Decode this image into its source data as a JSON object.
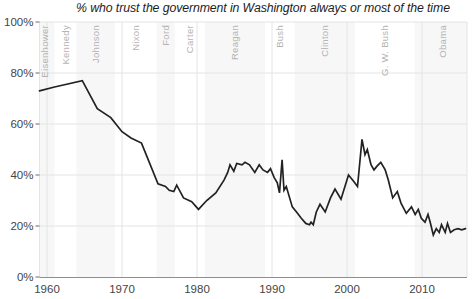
{
  "colors": {
    "line": "#222222",
    "grid": "#e4e4e4",
    "band": "#f7f7f7",
    "axis": "#8e8e8e",
    "tick": "#6a6a6a",
    "tick_label": "#454545",
    "president_label": "#b4b4b4",
    "title": "#1c1c1c",
    "background": "#ffffff"
  },
  "chart_data": {
    "type": "line",
    "title": "% who trust the government in Washington always or most of the time",
    "xlabel": "",
    "ylabel": "% who trust",
    "xlim": [
      1959,
      2016.5
    ],
    "ylim": [
      0,
      100
    ],
    "grid": true,
    "x_ticks": [
      1960,
      1970,
      1980,
      1990,
      2000,
      2010
    ],
    "x_tick_labels": [
      "1960",
      "1970",
      "1980",
      "1990",
      "2000",
      "2010"
    ],
    "y_ticks": [
      0,
      20,
      40,
      60,
      80,
      100
    ],
    "y_tick_labels": [
      "0%",
      "20%",
      "40%",
      "60%",
      "80%",
      "100%"
    ],
    "presidents": [
      {
        "name": "Eisenhower",
        "start": 1959,
        "end": 1961,
        "label_year": 1959.7,
        "shaded": true
      },
      {
        "name": "Kennedy",
        "start": 1961,
        "end": 1963.92,
        "label_year": 1962.4,
        "shaded": false
      },
      {
        "name": "Johnson",
        "start": 1963.92,
        "end": 1969.05,
        "label_year": 1966.4,
        "shaded": true
      },
      {
        "name": "Nixon",
        "start": 1969.05,
        "end": 1974.6,
        "label_year": 1971.8,
        "shaded": false
      },
      {
        "name": "Ford",
        "start": 1974.6,
        "end": 1977.05,
        "label_year": 1975.8,
        "shaded": true
      },
      {
        "name": "Carter",
        "start": 1977.05,
        "end": 1981.05,
        "label_year": 1979,
        "shaded": false
      },
      {
        "name": "Reagan",
        "start": 1981.05,
        "end": 1989.05,
        "label_year": 1985,
        "shaded": true
      },
      {
        "name": "Bush",
        "start": 1989.05,
        "end": 1993.05,
        "label_year": 1991,
        "shaded": false
      },
      {
        "name": "Clinton",
        "start": 1993.05,
        "end": 2001.05,
        "label_year": 1997,
        "shaded": true
      },
      {
        "name": "G. W. Bush",
        "start": 2001.05,
        "end": 2009.05,
        "label_year": 2005,
        "shaded": false
      },
      {
        "name": "Obama",
        "start": 2009.05,
        "end": 2016.5,
        "label_year": 2012.7,
        "shaded": true
      }
    ],
    "series": [
      {
        "name": "% who trust the government in Washington always or most of the time",
        "points": [
          [
            1959.0,
            73
          ],
          [
            1961,
            74.5
          ],
          [
            1964.7,
            77
          ],
          [
            1966.7,
            66
          ],
          [
            1968.5,
            62.5
          ],
          [
            1970,
            57
          ],
          [
            1971.2,
            54.5
          ],
          [
            1972.6,
            52.5
          ],
          [
            1974.8,
            36.5
          ],
          [
            1975.8,
            35.5
          ],
          [
            1976.3,
            34
          ],
          [
            1976.9,
            33.5
          ],
          [
            1977.3,
            36
          ],
          [
            1978.2,
            31
          ],
          [
            1979.3,
            29.5
          ],
          [
            1980.2,
            26.5
          ],
          [
            1981.3,
            30
          ],
          [
            1982.5,
            33
          ],
          [
            1983.6,
            38
          ],
          [
            1984.1,
            41
          ],
          [
            1984.4,
            44
          ],
          [
            1984.9,
            41.5
          ],
          [
            1985.3,
            44.5
          ],
          [
            1986,
            44
          ],
          [
            1986.4,
            45
          ],
          [
            1987,
            44
          ],
          [
            1987.7,
            41
          ],
          [
            1988.3,
            44
          ],
          [
            1988.8,
            42
          ],
          [
            1989.4,
            41
          ],
          [
            1989.8,
            42.5
          ],
          [
            1990.3,
            39
          ],
          [
            1990.7,
            37
          ],
          [
            1991.0,
            33
          ],
          [
            1991.35,
            46
          ],
          [
            1991.6,
            34
          ],
          [
            1991.9,
            35.5
          ],
          [
            1992.7,
            27.5
          ],
          [
            1993.4,
            25
          ],
          [
            1993.9,
            23
          ],
          [
            1994.5,
            21
          ],
          [
            1995.0,
            20.5
          ],
          [
            1995.2,
            21.5
          ],
          [
            1995.5,
            20.5
          ],
          [
            1995.9,
            25.5
          ],
          [
            1996.4,
            28.5
          ],
          [
            1997.1,
            25.5
          ],
          [
            1997.8,
            31
          ],
          [
            1998.4,
            34.5
          ],
          [
            1999.2,
            30.5
          ],
          [
            2000.2,
            40
          ],
          [
            2000.9,
            37.5
          ],
          [
            2001.4,
            35.5
          ],
          [
            2002.0,
            54
          ],
          [
            2002.4,
            48
          ],
          [
            2002.7,
            50
          ],
          [
            2003.2,
            44
          ],
          [
            2003.6,
            42
          ],
          [
            2004.0,
            43.5
          ],
          [
            2004.5,
            45
          ],
          [
            2005.1,
            42
          ],
          [
            2005.5,
            38
          ],
          [
            2006.1,
            31
          ],
          [
            2006.7,
            33.5
          ],
          [
            2007.2,
            29
          ],
          [
            2007.9,
            25
          ],
          [
            2008.6,
            27.5
          ],
          [
            2009.1,
            24.5
          ],
          [
            2009.5,
            26.5
          ],
          [
            2009.9,
            23
          ],
          [
            2010.4,
            21.5
          ],
          [
            2010.8,
            24.5
          ],
          [
            2011.1,
            21.5
          ],
          [
            2011.5,
            16.5
          ],
          [
            2011.9,
            19
          ],
          [
            2012.3,
            17.5
          ],
          [
            2012.6,
            20.5
          ],
          [
            2013.1,
            17.5
          ],
          [
            2013.4,
            21
          ],
          [
            2013.8,
            17.5
          ],
          [
            2014.3,
            18.5
          ],
          [
            2014.8,
            19
          ],
          [
            2015.3,
            18.5
          ],
          [
            2015.8,
            19
          ]
        ]
      }
    ]
  }
}
